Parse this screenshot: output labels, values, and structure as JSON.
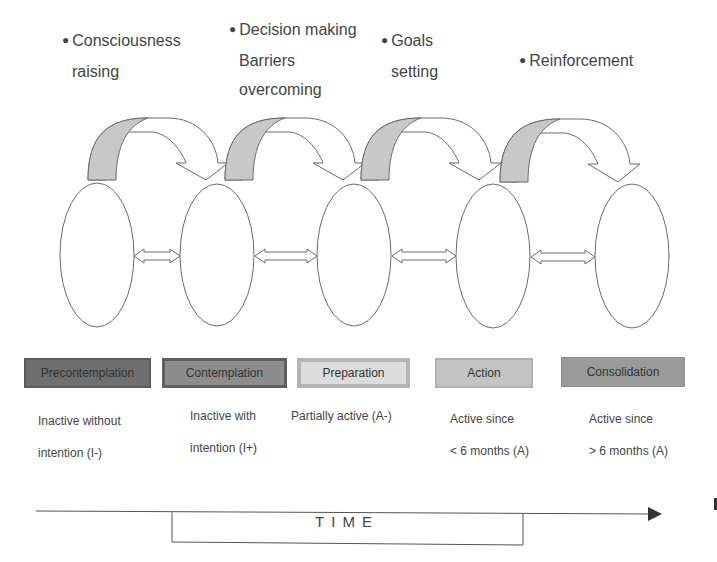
{
  "processes": [
    {
      "lines": [
        "Consciousness",
        "raising"
      ]
    },
    {
      "lines": [
        "Decision making",
        "Barriers",
        "overcoming"
      ]
    },
    {
      "lines": [
        "Goals",
        "setting"
      ]
    },
    {
      "lines": [
        "Reinforcement"
      ]
    }
  ],
  "stages": [
    {
      "label": "Precontemplation",
      "fill": "#6f6f6f",
      "border": "#5a5a5a",
      "desc": [
        "Inactive without",
        "intention (I-)"
      ]
    },
    {
      "label": "Contemplation",
      "fill": "#8d8d8d",
      "border": "#5f5f5f",
      "desc": [
        "Inactive with",
        "intention (I+)"
      ]
    },
    {
      "label": "Preparation",
      "fill": "#dcdcdc",
      "border": "#b4b4b4",
      "desc": [
        "Partially active (A-)"
      ]
    },
    {
      "label": "Action",
      "fill": "#c3c3c3",
      "border": "#b0b0b0",
      "desc": [
        "Active since",
        "< 6 months (A)"
      ]
    },
    {
      "label": "Consolidation",
      "fill": "#9a9a9a",
      "border": "#8e8e8e",
      "desc": [
        "Active since",
        "> 6 months (A)"
      ]
    }
  ],
  "timeline": {
    "label": "TIME"
  },
  "colors": {
    "arrow_shade": "#c8c8c8",
    "outline": "#6a6a6a"
  }
}
